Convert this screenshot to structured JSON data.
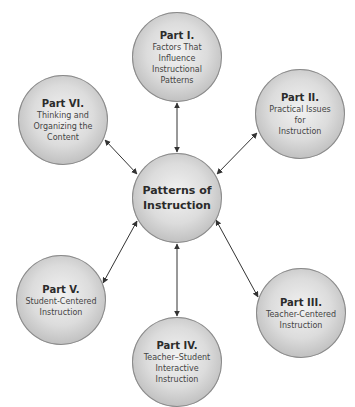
{
  "center": {
    "label_line1": "Patterns of",
    "label_line2": "Instruction"
  },
  "parts": [
    {
      "id": "part-1",
      "title": "Part I.",
      "subtitle": [
        "Factors That",
        "Influence",
        "Instructional",
        "Patterns"
      ]
    },
    {
      "id": "part-2",
      "title": "Part II.",
      "subtitle": [
        "Practical Issues",
        "for",
        "Instruction"
      ]
    },
    {
      "id": "part-3",
      "title": "Part III.",
      "subtitle": [
        "Teacher-Centered",
        "Instruction"
      ]
    },
    {
      "id": "part-4",
      "title": "Part IV.",
      "subtitle": [
        "Teacher–Student",
        "Interactive",
        "Instruction"
      ]
    },
    {
      "id": "part-5",
      "title": "Part V.",
      "subtitle": [
        "Student-Centered",
        "Instruction"
      ]
    },
    {
      "id": "part-6",
      "title": "Part VI.",
      "subtitle": [
        "Thinking and",
        "Organizing the",
        "Content"
      ]
    }
  ],
  "colors": {
    "arrow": "#333333",
    "node_border": "#8a8a8a"
  }
}
